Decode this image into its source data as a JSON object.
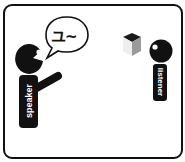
{
  "diagram": {
    "speaker": {
      "label": "speaker",
      "speech": "ユ~"
    },
    "listener": {
      "label": "listener"
    },
    "object": "cube",
    "colors": {
      "figure": "#111111",
      "label_text": "#ffffff",
      "frame": "#111111",
      "cube_top": "#1a1a1a",
      "cube_left": "#eeeeee",
      "cube_right": "#9a9a9a"
    }
  }
}
